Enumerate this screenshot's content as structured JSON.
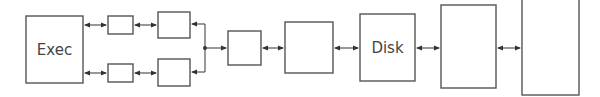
{
  "diagram": {
    "type": "block-diagram",
    "colors": {
      "stroke": "#555555",
      "text": "#444444",
      "background": "#ffffff"
    },
    "nodes": [
      {
        "id": "exec",
        "label": "Exec"
      },
      {
        "id": "buf_top",
        "label": ""
      },
      {
        "id": "buf_bottom",
        "label": ""
      },
      {
        "id": "ctrl_top",
        "label": ""
      },
      {
        "id": "ctrl_bottom",
        "label": ""
      },
      {
        "id": "mux",
        "label": ""
      },
      {
        "id": "cache",
        "label": ""
      },
      {
        "id": "disk",
        "label": "Disk"
      },
      {
        "id": "store1",
        "label": ""
      },
      {
        "id": "store2",
        "label": ""
      }
    ],
    "edges": [
      {
        "from": "exec",
        "to": "buf_top",
        "bidirectional": true
      },
      {
        "from": "exec",
        "to": "buf_bottom",
        "bidirectional": true
      },
      {
        "from": "buf_top",
        "to": "ctrl_top",
        "bidirectional": true
      },
      {
        "from": "buf_bottom",
        "to": "ctrl_bottom",
        "bidirectional": true
      },
      {
        "from": "junction",
        "to": "ctrl_top",
        "bidirectional": false
      },
      {
        "from": "junction",
        "to": "ctrl_bottom",
        "bidirectional": false
      },
      {
        "from": "junction",
        "to": "mux",
        "bidirectional": false
      },
      {
        "from": "mux",
        "to": "cache",
        "bidirectional": true
      },
      {
        "from": "cache",
        "to": "disk",
        "bidirectional": true
      },
      {
        "from": "disk",
        "to": "store1",
        "bidirectional": true
      },
      {
        "from": "store1",
        "to": "store2",
        "bidirectional": true
      }
    ]
  }
}
